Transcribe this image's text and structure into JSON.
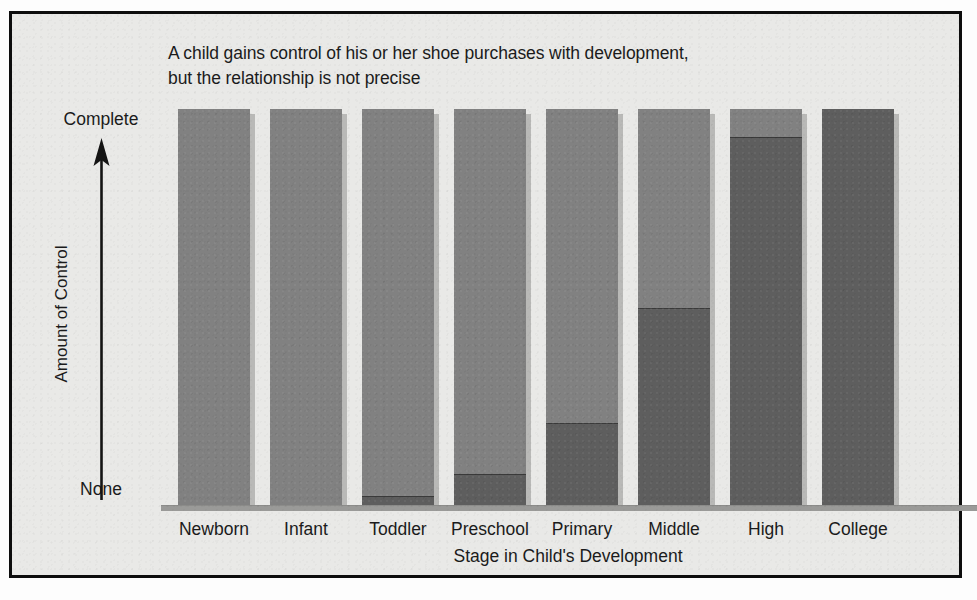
{
  "chart_data": {
    "type": "bar",
    "title": "A child gains control of his or her shoe purchases with development, but the relationship is not precise",
    "title_lines": [
      "A child gains control of his or her shoe purchases with development,",
      "but the relationship is not precise"
    ],
    "xlabel": "Stage in Child's Development",
    "ylabel": "Amount of Control",
    "categories": [
      "Newborn",
      "Infant",
      "Toddler",
      "Preschool",
      "Primary",
      "Middle",
      "High",
      "College"
    ],
    "y_tick_labels": [
      "None",
      "Complete"
    ],
    "ylim": [
      0,
      100
    ],
    "ylim_labels": {
      "min": "None",
      "max": "Complete"
    },
    "grid": false,
    "legend": "none",
    "stacked": true,
    "series": [
      {
        "name": "Child's control",
        "color": "#5e5e5e",
        "values": [
          0,
          0,
          2.5,
          8,
          21,
          50,
          93,
          100
        ]
      },
      {
        "name": "Others' control",
        "color": "#818181",
        "values": [
          100,
          100,
          97.5,
          92,
          79,
          50,
          7,
          0
        ]
      }
    ],
    "bars": [
      {
        "category": "Newborn",
        "child_control": 0,
        "other_control": 100
      },
      {
        "category": "Infant",
        "child_control": 0,
        "other_control": 100
      },
      {
        "category": "Toddler",
        "child_control": 2.5,
        "other_control": 97.5
      },
      {
        "category": "Preschool",
        "child_control": 8,
        "other_control": 92
      },
      {
        "category": "Primary",
        "child_control": 21,
        "other_control": 79
      },
      {
        "category": "Middle",
        "child_control": 50,
        "other_control": 50
      },
      {
        "category": "High",
        "child_control": 93,
        "other_control": 7
      },
      {
        "category": "College",
        "child_control": 100,
        "other_control": 0
      }
    ]
  },
  "colors": {
    "frame_border": "#0d0d0d",
    "background": "#e9e9e7",
    "bar_light": "#818181",
    "bar_dark": "#5e5e5e",
    "baseline": "#9a9a98",
    "text": "#1b1b1b"
  }
}
